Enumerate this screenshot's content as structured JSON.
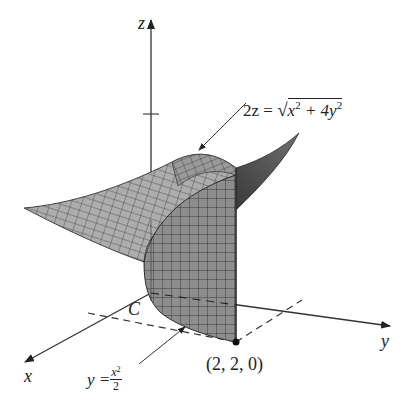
{
  "figure": {
    "type": "3d-surface-diagram",
    "axes": {
      "x_label": "x",
      "y_label": "y",
      "z_label": "z"
    },
    "labels": {
      "surface_equation_lhs": "2z = ",
      "surface_equation_radicand_parts": [
        "x",
        "2",
        " + 4y",
        "2"
      ],
      "surface_equation_text": "2z = √(x² + 4y²)",
      "curve_name": "C",
      "curve_equation_lhs": "y = ",
      "curve_equation_num": "x",
      "curve_equation_num_exp": "2",
      "curve_equation_den": "2",
      "curve_equation_text": "y = x²/2",
      "point_label": "(2, 2, 0)"
    },
    "colors": {
      "axis": "#333333",
      "surface_fill": "#a9a9a9",
      "surface_dark": "#5a5a5a",
      "wall_fill": "#8c8c8c",
      "mesh_line": "#3a3a3a",
      "text": "#222222"
    }
  }
}
